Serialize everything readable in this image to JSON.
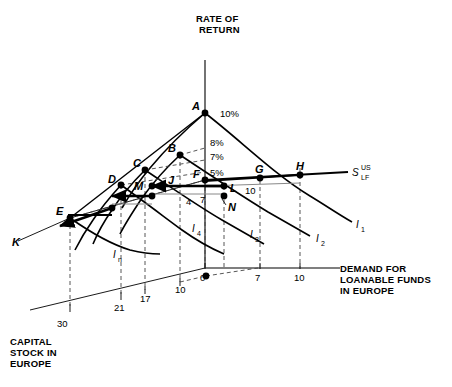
{
  "figure": {
    "axes": {
      "vertical": {
        "name": "rate-of-return",
        "label_line1": "RATE OF",
        "label_line2": "RETURN"
      },
      "horizontal": {
        "name": "demand-for-loanable-funds",
        "label_line1": "DEMAND FOR",
        "label_line2": "LOANABLE FUNDS",
        "label_line3": "IN EUROPE",
        "ticks": [
          "0",
          "7",
          "10"
        ]
      },
      "depth": {
        "name": "capital-stock-in-europe",
        "label_line1": "CAPITAL",
        "label_line2": "STOCK IN",
        "label_line3": "EUROPE",
        "ticks": [
          "30",
          "21",
          "17",
          "10"
        ]
      }
    },
    "rate_labels": [
      "10%",
      "8%",
      "7%",
      "5%"
    ],
    "points": [
      "A",
      "B",
      "C",
      "D",
      "E",
      "F",
      "G",
      "H",
      "J",
      "K",
      "L",
      "M",
      "N"
    ],
    "curve_labels": {
      "supply": {
        "base": "S",
        "sub": "LF",
        "sup": "US"
      },
      "investment": [
        "I",
        "I",
        "I",
        "I",
        "I"
      ],
      "i1": "I",
      "i1_sub": "1",
      "i2": "I",
      "i2_sub": "2",
      "i3": "I",
      "i3_sub": "3",
      "i4": "I",
      "i4_sub": "4",
      "in": "I",
      "in_sub": "n"
    },
    "measure_labels": [
      "4",
      "7",
      "10"
    ]
  }
}
